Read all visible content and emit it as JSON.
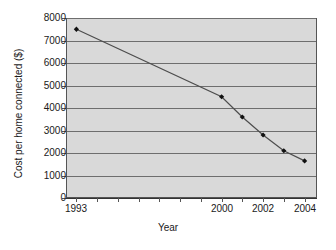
{
  "chart_data": {
    "type": "line",
    "title": "",
    "xlabel": "Year",
    "ylabel": "Cost per home connected ($)",
    "x": [
      1993,
      2000,
      2001,
      2002,
      2003,
      2004
    ],
    "values": [
      7500,
      4500,
      3600,
      2800,
      2100,
      1650
    ],
    "series": [
      {
        "name": "Cost per home connected",
        "values": [
          7500,
          4500,
          3600,
          2800,
          2100,
          1650
        ]
      }
    ],
    "xlim": [
      1992.5,
      2004.6
    ],
    "ylim": [
      0,
      8000
    ],
    "ytick_labels": [
      "8000",
      "7000",
      "6000",
      "5000",
      "4000",
      "3000",
      "2000",
      "1000",
      "0"
    ],
    "ytick_values": [
      8000,
      7000,
      6000,
      5000,
      4000,
      3000,
      2000,
      1000,
      0
    ],
    "xtick_values": [
      1993,
      1994,
      1995,
      1996,
      1997,
      1998,
      1999,
      2000,
      2001,
      2002,
      2003,
      2004
    ],
    "xtick_labels": [
      "1993",
      "",
      "",
      "",
      "",
      "",
      "",
      "2000",
      "",
      "2002",
      "",
      "2004"
    ],
    "grid": true,
    "legend": "none",
    "marker": "filled-diamond",
    "line_color": "#4d4d4d",
    "marker_color": "#111111",
    "plot_background": "#d9d9d9",
    "grid_color": "#6e6e6e",
    "axis_color": "#555555"
  }
}
